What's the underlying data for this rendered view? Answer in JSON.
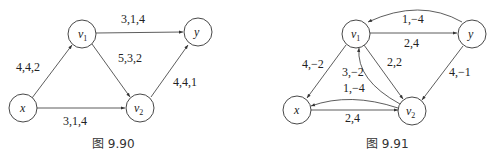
{
  "figures": [
    {
      "id": "fig-9-90",
      "caption": "图 9.90",
      "nodes": {
        "x": {
          "label": "x",
          "sub": ""
        },
        "v1": {
          "label": "v",
          "sub": "1"
        },
        "y": {
          "label": "y",
          "sub": ""
        },
        "v2": {
          "label": "v",
          "sub": "2"
        }
      },
      "edges": [
        {
          "from": "x",
          "to": "v1",
          "label": "4,4,2"
        },
        {
          "from": "v1",
          "to": "y",
          "label": "3,1,4"
        },
        {
          "from": "v1",
          "to": "v2",
          "label": "5,3,2"
        },
        {
          "from": "v2",
          "to": "y",
          "label": "4,4,1"
        },
        {
          "from": "x",
          "to": "v2",
          "label": "3,1,4"
        }
      ]
    },
    {
      "id": "fig-9-91",
      "caption": "图 9.91",
      "nodes": {
        "x": {
          "label": "x",
          "sub": ""
        },
        "v1": {
          "label": "v",
          "sub": "1"
        },
        "y": {
          "label": "y",
          "sub": ""
        },
        "v2": {
          "label": "v",
          "sub": "2"
        }
      },
      "edges": [
        {
          "from": "y",
          "to": "v1",
          "label": "1,−4"
        },
        {
          "from": "v1",
          "to": "y",
          "label": "2,4"
        },
        {
          "from": "v1",
          "to": "x",
          "label": "4,−2"
        },
        {
          "from": "v2",
          "to": "v1",
          "label": "3,−2"
        },
        {
          "from": "v1",
          "to": "v2",
          "label": "2,2"
        },
        {
          "from": "y",
          "to": "v2",
          "label": "4,−1"
        },
        {
          "from": "v2",
          "to": "x",
          "label": "1,−4"
        },
        {
          "from": "x",
          "to": "v2",
          "label": "2,4"
        }
      ]
    }
  ]
}
